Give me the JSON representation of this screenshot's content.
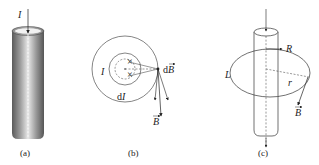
{
  "panels": [
    {
      "id": "a",
      "caption": "(a)",
      "labels": {
        "current": "I"
      },
      "description": "Solid cylindrical conductor with current I flowing down its axis"
    },
    {
      "id": "b",
      "caption": "(b)",
      "labels": {
        "current": "I",
        "element_current": "dI",
        "field_element": "dB",
        "field": "B"
      },
      "description": "Cross-section: current elements dI produce field contributions dB summing to B tangent to circle"
    },
    {
      "id": "c",
      "caption": "(c)",
      "labels": {
        "loop": "L",
        "radius_cylinder": "R",
        "radius_loop": "r",
        "field": "B"
      },
      "description": "Cylinder of radius R with Amperian loop L of radius r; B tangent to loop"
    }
  ],
  "colors": {
    "stroke": "#222222",
    "cylinder_dark": "#6b6b6b",
    "cylinder_light": "#e6e6e6"
  }
}
